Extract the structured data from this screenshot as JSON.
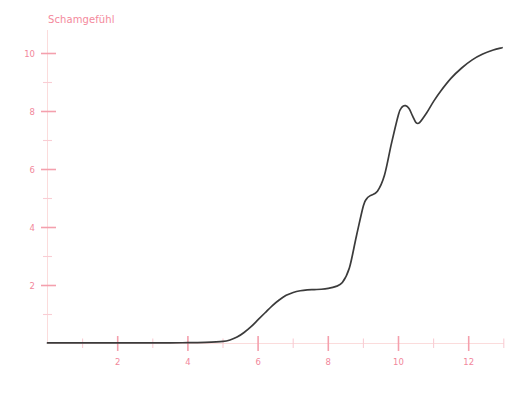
{
  "chart_data": {
    "type": "line",
    "title": "",
    "ylabel": "Schamgefühl",
    "xlabel": "",
    "xlim": [
      0,
      13.0
    ],
    "ylim": [
      0,
      10.6
    ],
    "grid": false,
    "legend": null,
    "x_ticks_major": [
      2,
      4,
      6,
      8,
      10,
      12
    ],
    "x_ticks_minor": [
      1,
      3,
      5,
      7,
      9,
      11,
      13
    ],
    "y_ticks_major": [
      2,
      4,
      6,
      8,
      10
    ],
    "y_ticks_minor": [
      1,
      3,
      5,
      7,
      9
    ],
    "x_tick_labels": [
      "2",
      "4",
      "6",
      "8",
      "10",
      "12"
    ],
    "y_tick_labels": [
      "2",
      "4",
      "6",
      "8",
      "10"
    ],
    "series": [
      {
        "name": "Schamgefühl",
        "color": "#3b3b3b",
        "x": [
          0.0,
          0.5,
          1.0,
          1.5,
          2.0,
          2.5,
          3.0,
          3.5,
          4.0,
          4.5,
          5.0,
          5.2,
          5.4,
          5.6,
          5.8,
          6.0,
          6.2,
          6.4,
          6.6,
          6.8,
          7.0,
          7.2,
          7.4,
          7.6,
          7.8,
          8.0,
          8.2,
          8.4,
          8.6,
          8.8,
          9.0,
          9.1,
          9.2,
          9.4,
          9.6,
          9.8,
          10.0,
          10.1,
          10.2,
          10.3,
          10.4,
          10.5,
          10.6,
          10.8,
          11.0,
          11.2,
          11.5,
          11.8,
          12.1,
          12.4,
          12.7,
          12.95
        ],
        "y": [
          0.02,
          0.02,
          0.02,
          0.02,
          0.02,
          0.02,
          0.02,
          0.02,
          0.03,
          0.04,
          0.07,
          0.12,
          0.22,
          0.38,
          0.58,
          0.82,
          1.06,
          1.3,
          1.5,
          1.66,
          1.76,
          1.82,
          1.85,
          1.86,
          1.87,
          1.9,
          1.96,
          2.1,
          2.6,
          3.7,
          4.75,
          5.0,
          5.1,
          5.25,
          5.8,
          6.9,
          7.9,
          8.15,
          8.2,
          8.1,
          7.85,
          7.62,
          7.62,
          7.95,
          8.35,
          8.7,
          9.15,
          9.5,
          9.78,
          9.98,
          10.12,
          10.2
        ]
      }
    ]
  },
  "axis": {
    "y_axis_title": "Schamgefühl"
  }
}
